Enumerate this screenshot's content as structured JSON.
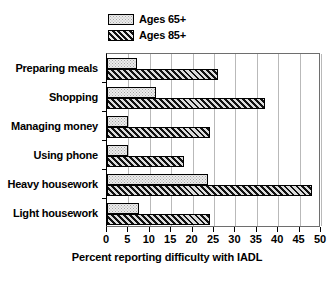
{
  "chart_data": {
    "type": "bar",
    "orientation": "horizontal",
    "title": "",
    "xlabel": "Percent reporting difficulty with IADL",
    "ylabel": "",
    "xlim": [
      0,
      50
    ],
    "xticks": [
      0,
      5,
      10,
      15,
      20,
      25,
      30,
      35,
      40,
      45,
      50
    ],
    "xtick_labels": [
      "0",
      "5",
      "10",
      "15",
      "20",
      "25",
      "30",
      "35",
      "40",
      "45",
      "50"
    ],
    "grid": true,
    "grid_axis": "x",
    "legend_position": "top-left",
    "categories": [
      "Preparing meals",
      "Shopping",
      "Managing money",
      "Using phone",
      "Heavy housework",
      "Light housework"
    ],
    "series": [
      {
        "name": "Ages 65+",
        "pattern": "stipple-light",
        "color": "#ececec",
        "values": [
          7,
          11.5,
          5,
          5,
          23.5,
          7.5
        ]
      },
      {
        "name": "Ages 85+",
        "pattern": "diagonal-hatch-dark",
        "color": "#3d3d3d",
        "values": [
          26,
          37,
          24,
          18,
          48,
          24
        ]
      }
    ]
  },
  "legend": {
    "items": [
      {
        "label": "Ages 65+",
        "swatch": "legend-swatch-light"
      },
      {
        "label": "Ages 85+",
        "swatch": "legend-swatch-hatch"
      }
    ]
  }
}
